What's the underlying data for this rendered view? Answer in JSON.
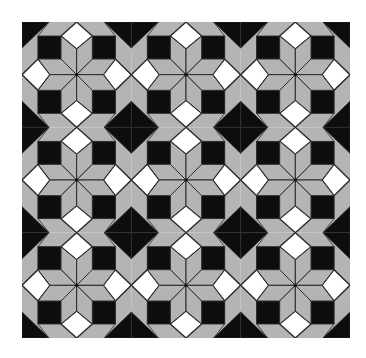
{
  "image": {
    "subject": "LeMoyne star quilt pattern",
    "grid": {
      "rows": 3,
      "cols": 3
    },
    "colors": {
      "background": "#ffffff",
      "gray": "#b4b4b4",
      "black": "#0d0d0d",
      "white": "#ffffff",
      "line": "#2a2a2a"
    },
    "block_elements": [
      "black corner triangles",
      "gray octagon ring",
      "8 gray star rhombi",
      "4 white diamond squares",
      "4 black squares"
    ]
  }
}
